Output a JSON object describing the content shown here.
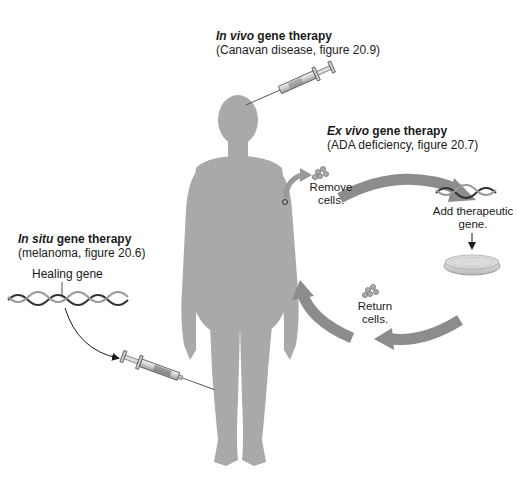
{
  "in_vivo": {
    "title_italic": "In vivo",
    "title_rest": " gene therapy",
    "subtitle": "(Canavan disease, figure 20.9)"
  },
  "ex_vivo": {
    "title_italic": "Ex vivo",
    "title_rest": " gene therapy",
    "subtitle": "(ADA deficiency, figure 20.7)",
    "steps": {
      "remove": [
        "Remove",
        "cells."
      ],
      "add": [
        "Add therapeutic",
        "gene."
      ],
      "return": [
        "Return",
        "cells."
      ]
    }
  },
  "in_situ": {
    "title_italic": "In situ",
    "title_rest": " gene therapy",
    "subtitle": "(melanoma, figure 20.6)",
    "gene_label": "Healing gene"
  },
  "colors": {
    "body": "#a9a9a9",
    "arrow": "#8c8c8c",
    "text": "#1a1a1a"
  }
}
